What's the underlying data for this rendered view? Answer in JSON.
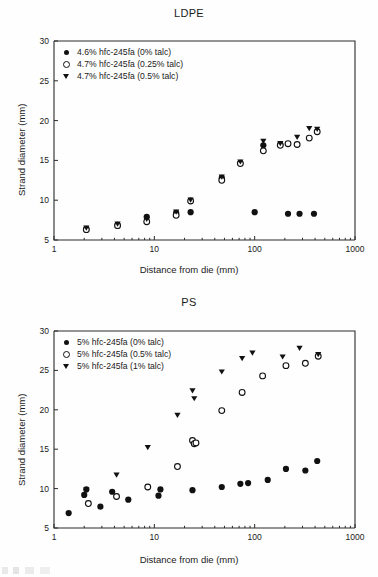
{
  "figures": [
    {
      "id": "ldpe",
      "title": "LDPE",
      "xlabel": "Distance from die (mm)",
      "ylabel": "Strand diameter (mm)",
      "legend": [
        {
          "symbol": "filled-circle",
          "label": "4.6% hfc-245fa (0% talc)"
        },
        {
          "symbol": "open-circle",
          "label": "4.7% hfc-245fa (0.25% talc)"
        },
        {
          "symbol": "filled-triangle-down",
          "label": "4.7% hfc-245fa (0.5% talc)"
        }
      ]
    },
    {
      "id": "ps",
      "title": "PS",
      "xlabel": "Distance from die (mm)",
      "ylabel": "Strand diameter (mm)",
      "legend": [
        {
          "symbol": "filled-circle",
          "label": "5% hfc-245fa (0% talc)"
        },
        {
          "symbol": "open-circle",
          "label": "5% hfc-245fa (0.5% talc)"
        },
        {
          "symbol": "filled-triangle-down",
          "label": "5% hfc-245fa (1% talc)"
        }
      ]
    }
  ],
  "chart_data": [
    {
      "type": "scatter",
      "title": "LDPE",
      "xlabel": "Distance from die (mm)",
      "ylabel": "Strand diameter (mm)",
      "xscale": "log",
      "yscale": "linear",
      "xlim": [
        1,
        1000
      ],
      "ylim": [
        5,
        30
      ],
      "xticks": [
        1,
        10,
        100,
        1000
      ],
      "yticks": [
        5,
        10,
        15,
        20,
        25,
        30
      ],
      "grid": false,
      "legend_position": "top-left",
      "series": [
        {
          "name": "4.6% hfc-245fa (0% talc)",
          "marker": "filled-circle",
          "points": [
            [
              2.1,
              6.4
            ],
            [
              4.3,
              6.9
            ],
            [
              8.4,
              7.9
            ],
            [
              16.5,
              8.4
            ],
            [
              23,
              8.5
            ],
            [
              47,
              12.8
            ],
            [
              72,
              14.7
            ],
            [
              100,
              8.5
            ],
            [
              122,
              16.9
            ],
            [
              180,
              17.0
            ],
            [
              215,
              8.3
            ],
            [
              280,
              8.3
            ],
            [
              390,
              8.3
            ]
          ]
        },
        {
          "name": "4.7% hfc-245fa (0.25% talc)",
          "marker": "open-circle",
          "points": [
            [
              2.1,
              6.3
            ],
            [
              4.3,
              6.8
            ],
            [
              8.4,
              7.3
            ],
            [
              16.5,
              8.1
            ],
            [
              23,
              9.9
            ],
            [
              47,
              12.5
            ],
            [
              72,
              14.6
            ],
            [
              122,
              16.2
            ],
            [
              180,
              16.9
            ],
            [
              215,
              17.1
            ],
            [
              265,
              17.0
            ],
            [
              350,
              17.8
            ],
            [
              420,
              18.6
            ]
          ]
        },
        {
          "name": "4.7% hfc-245fa (0.5% talc)",
          "marker": "filled-triangle-down",
          "points": [
            [
              2.1,
              6.5
            ],
            [
              4.3,
              7.0
            ],
            [
              8.4,
              7.6
            ],
            [
              16.5,
              8.5
            ],
            [
              23,
              10.0
            ],
            [
              47,
              12.9
            ],
            [
              72,
              14.8
            ],
            [
              122,
              17.4
            ],
            [
              180,
              17.1
            ],
            [
              265,
              17.9
            ],
            [
              350,
              19.0
            ],
            [
              420,
              18.9
            ]
          ]
        }
      ]
    },
    {
      "type": "scatter",
      "title": "PS",
      "xlabel": "Distance from die (mm)",
      "ylabel": "Strand diameter (mm)",
      "xscale": "log",
      "yscale": "linear",
      "xlim": [
        1,
        1000
      ],
      "ylim": [
        5,
        30
      ],
      "xticks": [
        1,
        10,
        100,
        1000
      ],
      "yticks": [
        5,
        10,
        15,
        20,
        25,
        30
      ],
      "grid": false,
      "legend_position": "top-left",
      "series": [
        {
          "name": "5% hfc-245fa (0% talc)",
          "marker": "filled-circle",
          "points": [
            [
              1.4,
              6.9
            ],
            [
              2.0,
              9.2
            ],
            [
              2.1,
              9.9
            ],
            [
              2.9,
              7.7
            ],
            [
              3.8,
              9.6
            ],
            [
              5.5,
              8.6
            ],
            [
              11.0,
              9.1
            ],
            [
              11.5,
              9.9
            ],
            [
              24,
              9.8
            ],
            [
              47,
              10.2
            ],
            [
              72,
              10.6
            ],
            [
              86,
              10.7
            ],
            [
              135,
              11.1
            ],
            [
              205,
              12.5
            ],
            [
              320,
              12.3
            ],
            [
              420,
              13.5
            ]
          ]
        },
        {
          "name": "5% hfc-245fa (0.5% talc)",
          "marker": "open-circle",
          "points": [
            [
              2.2,
              8.1
            ],
            [
              4.2,
              9.0
            ],
            [
              8.6,
              10.2
            ],
            [
              17,
              12.8
            ],
            [
              24,
              16.1
            ],
            [
              25,
              15.7
            ],
            [
              26,
              15.8
            ],
            [
              47,
              19.9
            ],
            [
              75,
              22.2
            ],
            [
              120,
              24.3
            ],
            [
              205,
              25.6
            ],
            [
              320,
              25.9
            ],
            [
              430,
              26.8
            ]
          ]
        },
        {
          "name": "5% hfc-245fa (1% talc)",
          "marker": "filled-triangle-down",
          "points": [
            [
              2.1,
              9.8
            ],
            [
              4.2,
              11.7
            ],
            [
              8.6,
              15.2
            ],
            [
              17,
              19.3
            ],
            [
              24,
              22.4
            ],
            [
              25,
              21.4
            ],
            [
              47,
              24.8
            ],
            [
              75,
              26.5
            ],
            [
              95,
              27.2
            ],
            [
              190,
              26.7
            ],
            [
              280,
              27.8
            ],
            [
              430,
              27.0
            ]
          ]
        }
      ]
    }
  ]
}
